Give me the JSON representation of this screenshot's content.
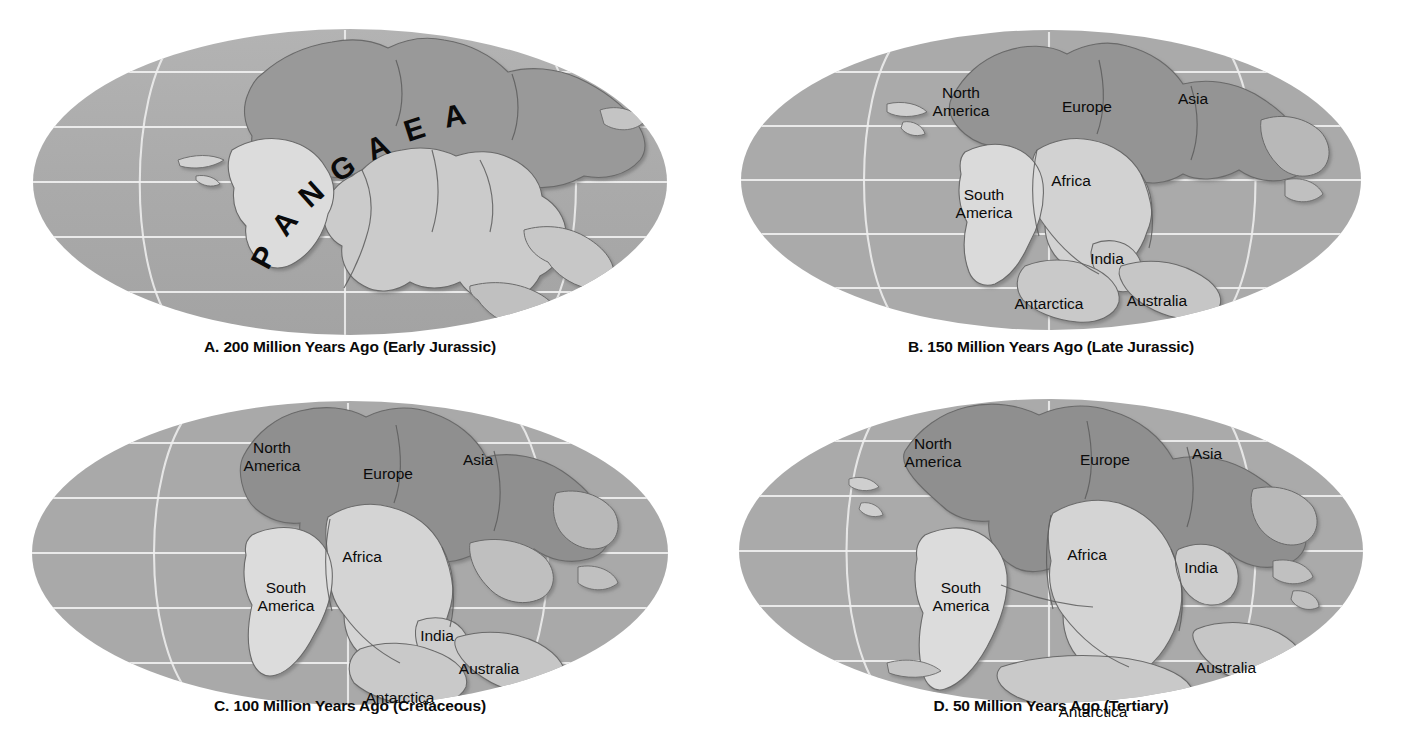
{
  "figure": {
    "background_color": "#ffffff",
    "palette": {
      "ocean": "#a9a9a9",
      "ocean_light": "#b4b4b4",
      "land_light": "#cfcfcf",
      "land_dark": "#9a9a9a",
      "land_highlight": "#e8e8e8",
      "graticule": "#f2f2f2",
      "coast_line": "#4a4a4a",
      "label_text": "#0b0b0b",
      "caption_text": "#0a0a0a"
    },
    "projection": "Mollweide (oval world projection)",
    "graticule": {
      "latitude_lines": 5,
      "longitude_lines": 3,
      "visible": true,
      "color": "#f2f2f2"
    }
  },
  "panels": [
    {
      "id": "a",
      "letter": "A.",
      "caption": "A. 200 Million Years Ago (Early Jurassic)",
      "age_value": 200,
      "age_units": "Million Years Ago",
      "period": "Early Jurassic",
      "supercontinent_label": "PANGAEA",
      "supercontinent_letters": [
        "P",
        "A",
        "N",
        "G",
        "A",
        "E",
        "A"
      ],
      "labels": []
    },
    {
      "id": "b",
      "letter": "B.",
      "caption": "B. 150 Million Years Ago (Late Jurassic)",
      "age_value": 150,
      "age_units": "Million Years Ago",
      "period": "Late Jurassic",
      "supercontinent_label": null,
      "labels": [
        {
          "name": "North America",
          "lines": [
            "North",
            "America"
          ],
          "x": 260,
          "y": 98
        },
        {
          "name": "Europe",
          "lines": [
            "Europe"
          ],
          "x": 386,
          "y": 112
        },
        {
          "name": "Asia",
          "lines": [
            "Asia"
          ],
          "x": 492,
          "y": 104
        },
        {
          "name": "Africa",
          "lines": [
            "Africa"
          ],
          "x": 370,
          "y": 186
        },
        {
          "name": "South America",
          "lines": [
            "South",
            "America"
          ],
          "x": 283,
          "y": 200
        },
        {
          "name": "India",
          "lines": [
            "India"
          ],
          "x": 406,
          "y": 264
        },
        {
          "name": "Antarctica",
          "lines": [
            "Antarctica"
          ],
          "x": 348,
          "y": 309
        },
        {
          "name": "Australia",
          "lines": [
            "Australia"
          ],
          "x": 456,
          "y": 306
        }
      ]
    },
    {
      "id": "c",
      "letter": "C.",
      "caption": "C. 100 Million Years Ago (Cretaceous)",
      "age_value": 100,
      "age_units": "Million Years Ago",
      "period": "Cretaceous",
      "supercontinent_label": null,
      "labels": [
        {
          "name": "North America",
          "lines": [
            "North",
            "America"
          ],
          "x": 272,
          "y": 68
        },
        {
          "name": "Europe",
          "lines": [
            "Europe"
          ],
          "x": 388,
          "y": 94
        },
        {
          "name": "Asia",
          "lines": [
            "Asia"
          ],
          "x": 478,
          "y": 80
        },
        {
          "name": "Africa",
          "lines": [
            "Africa"
          ],
          "x": 362,
          "y": 177
        },
        {
          "name": "South America",
          "lines": [
            "South",
            "America"
          ],
          "x": 286,
          "y": 208
        },
        {
          "name": "India",
          "lines": [
            "India"
          ],
          "x": 437,
          "y": 256
        },
        {
          "name": "Australia",
          "lines": [
            "Australia"
          ],
          "x": 489,
          "y": 289
        },
        {
          "name": "Antarctica",
          "lines": [
            "Antarctica"
          ],
          "x": 400,
          "y": 318
        }
      ]
    },
    {
      "id": "d",
      "letter": "D.",
      "caption": "D. 50 Million Years Ago (Tertiary)",
      "age_value": 50,
      "age_units": "Million Years Ago",
      "period": "Tertiary",
      "supercontinent_label": null,
      "labels": [
        {
          "name": "North America",
          "lines": [
            "North",
            "America"
          ],
          "x": 232,
          "y": 64
        },
        {
          "name": "Europe",
          "lines": [
            "Europe"
          ],
          "x": 404,
          "y": 80
        },
        {
          "name": "Asia",
          "lines": [
            "Asia"
          ],
          "x": 506,
          "y": 74
        },
        {
          "name": "Africa",
          "lines": [
            "Africa"
          ],
          "x": 386,
          "y": 175
        },
        {
          "name": "South America",
          "lines": [
            "South",
            "America"
          ],
          "x": 260,
          "y": 208
        },
        {
          "name": "India",
          "lines": [
            "India"
          ],
          "x": 500,
          "y": 188
        },
        {
          "name": "Australia",
          "lines": [
            "Australia"
          ],
          "x": 525,
          "y": 288
        },
        {
          "name": "Antarctica",
          "lines": [
            "Antarctica"
          ],
          "x": 392,
          "y": 332
        }
      ]
    }
  ]
}
